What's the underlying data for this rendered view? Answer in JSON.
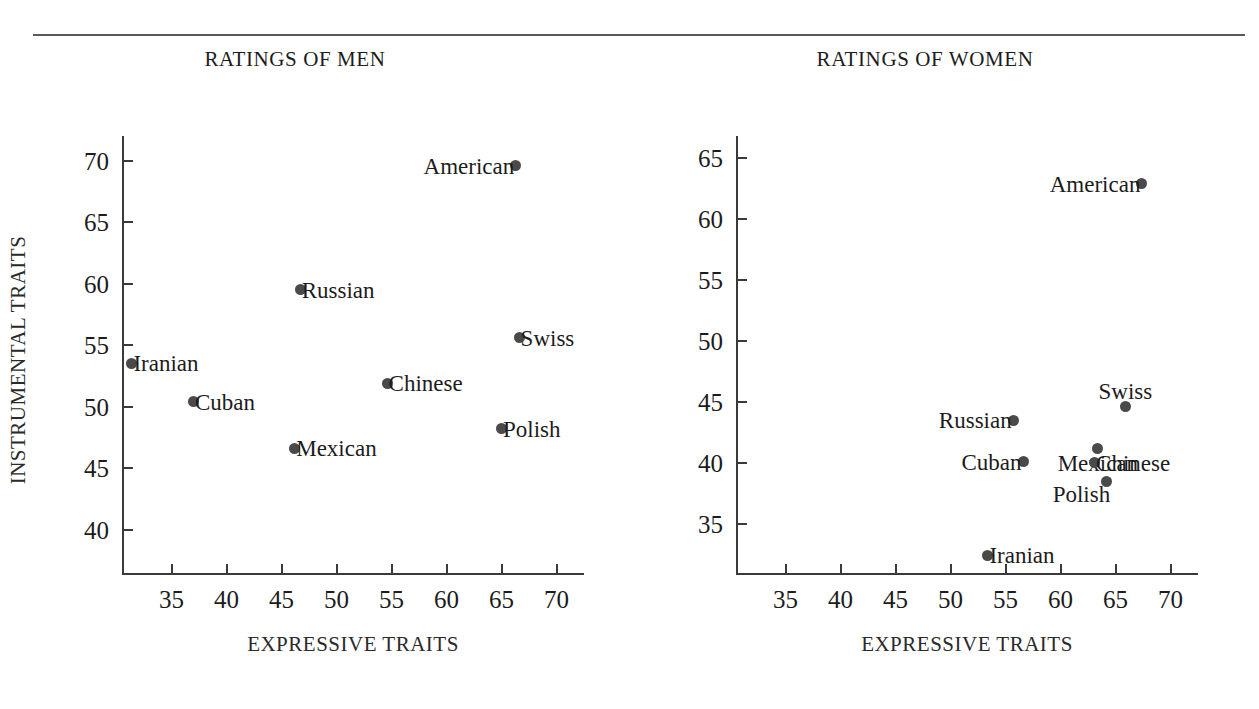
{
  "figure": {
    "has_top_rule": true,
    "background": "#ffffff",
    "ink_color": "#1c1c1c",
    "point_color": "#4a4a4a"
  },
  "chart_data": [
    {
      "type": "scatter",
      "title": "RATINGS OF MEN",
      "xlabel": "EXPRESSIVE TRAITS",
      "ylabel": "INSTRUMENTAL TRAITS",
      "xlim": [
        30.5,
        72.5
      ],
      "ylim": [
        36.3,
        72.0
      ],
      "xticks": [
        35,
        40,
        45,
        50,
        55,
        60,
        65,
        70
      ],
      "yticks": [
        40,
        45,
        50,
        55,
        60,
        65,
        70
      ],
      "grid": false,
      "legend": "none",
      "points": [
        {
          "label": "American",
          "x": 66.3,
          "y": 69.6,
          "label_pos": "left"
        },
        {
          "label": "Russian",
          "x": 46.7,
          "y": 59.5,
          "label_pos": "right"
        },
        {
          "label": "Swiss",
          "x": 66.6,
          "y": 55.6,
          "label_pos": "right"
        },
        {
          "label": "Iranian",
          "x": 31.4,
          "y": 53.5,
          "label_pos": "right"
        },
        {
          "label": "Chinese",
          "x": 54.6,
          "y": 51.9,
          "label_pos": "right"
        },
        {
          "label": "Cuban",
          "x": 37.0,
          "y": 50.4,
          "label_pos": "right"
        },
        {
          "label": "Polish",
          "x": 65.0,
          "y": 48.2,
          "label_pos": "right"
        },
        {
          "label": "Mexican",
          "x": 46.2,
          "y": 46.6,
          "label_pos": "right"
        }
      ]
    },
    {
      "type": "scatter",
      "title": "RATINGS OF WOMEN",
      "xlabel": "EXPRESSIVE TRAITS",
      "ylabel": "",
      "xlim": [
        30.5,
        72.5
      ],
      "ylim": [
        30.8,
        66.8
      ],
      "xticks": [
        35,
        40,
        45,
        50,
        55,
        60,
        65,
        70
      ],
      "yticks": [
        35,
        40,
        45,
        50,
        55,
        60,
        65
      ],
      "grid": false,
      "legend": "none",
      "points": [
        {
          "label": "American",
          "x": 67.4,
          "y": 62.9,
          "label_pos": "left"
        },
        {
          "label": "Swiss",
          "x": 65.9,
          "y": 44.6,
          "label_pos": "above"
        },
        {
          "label": "Russian",
          "x": 55.7,
          "y": 43.5,
          "label_pos": "left"
        },
        {
          "label": "Mexican",
          "x": 63.4,
          "y": 41.2,
          "label_pos": "below"
        },
        {
          "label": "Cuban",
          "x": 56.6,
          "y": 40.1,
          "label_pos": "left"
        },
        {
          "label": "Chinese",
          "x": 63.1,
          "y": 40.0,
          "label_pos": "right"
        },
        {
          "label": "Polish",
          "x": 64.2,
          "y": 38.5,
          "label_pos": "below-left"
        },
        {
          "label": "Iranian",
          "x": 53.4,
          "y": 32.4,
          "label_pos": "right"
        }
      ]
    }
  ]
}
